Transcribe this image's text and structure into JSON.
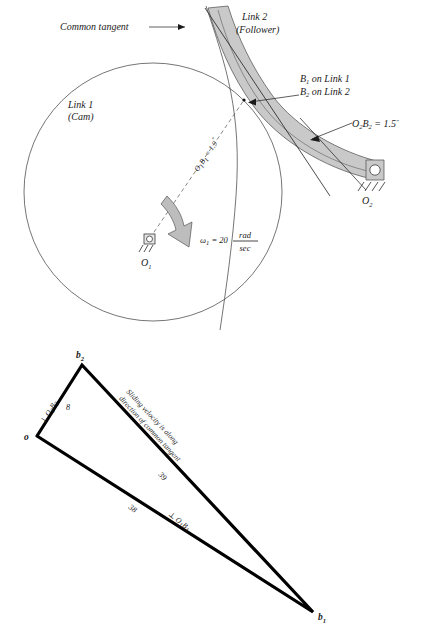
{
  "figure": {
    "upper_diagram": {
      "name": "cam-follower-mechanism",
      "labels": {
        "common_tangent": "Common tangent",
        "link1_line1": "Link 1",
        "link1_line2": "(Cam)",
        "link2_line1": "Link 2",
        "link2_line2": "(Follower)",
        "contact_line1_main": "B",
        "contact_line1_sub": "1",
        "contact_line1_rest": " on Link 1",
        "contact_line2_main": "B",
        "contact_line2_sub": "2",
        "contact_line2_rest": " on Link 2",
        "o2b2_dim_main": "O",
        "o2b2_dim_sub1": "2",
        "o2b2_dim_mid": "B",
        "o2b2_dim_sub2": "2",
        "o2b2_dim_value": " = 1.5",
        "o2b2_dim_unit": "\"",
        "o1b1_dim_main": "O",
        "o1b1_dim_sub1": "1",
        "o1b1_dim_mid": "B",
        "o1b1_dim_sub2": "1",
        "o1b1_dim_value": " = 1.9",
        "o1b1_dim_unit": "\"",
        "omega_symbol": "ω",
        "omega_sub": "1",
        "omega_equals": " = 20",
        "omega_num": "rad",
        "omega_den": "sec",
        "pivot_o1_main": "O",
        "pivot_o1_sub": "1",
        "pivot_o2_main": "O",
        "pivot_o2_sub": "2"
      },
      "values": {
        "o1b1_inches": 1.9,
        "o2b2_inches": 1.5,
        "omega1_rad_per_sec": 20
      }
    },
    "lower_diagram": {
      "name": "velocity-polygon",
      "labels": {
        "vertex_o": "o",
        "vertex_b2_main": "b",
        "vertex_b2_sub": "2",
        "vertex_b1_main": "b",
        "vertex_b1_sub": "1",
        "perp_o2b2_main": "⊥ O",
        "perp_o2b2_sub1": "2",
        "perp_o2b2_mid": "B",
        "perp_o2b2_sub2": "2",
        "perp_o1b1_main": "⊥ O",
        "perp_o1b1_sub1": "1",
        "perp_o1b1_mid": "B",
        "perp_o1b1_sub2": "1",
        "mag_ob2": "8",
        "mag_b2b1": "39",
        "mag_ob1": "38",
        "sliding_line1": "Sliding velocity is along",
        "sliding_line2": "direction of common tangent"
      },
      "values": {
        "ob2_magnitude": 8,
        "b2b1_magnitude": 39,
        "ob1_magnitude": 38
      }
    },
    "colors": {
      "band_fill": "#c9c9c9",
      "arrow_fill": "#bdbdbd",
      "stroke": "#1a1a1a",
      "background": "#ffffff"
    }
  }
}
